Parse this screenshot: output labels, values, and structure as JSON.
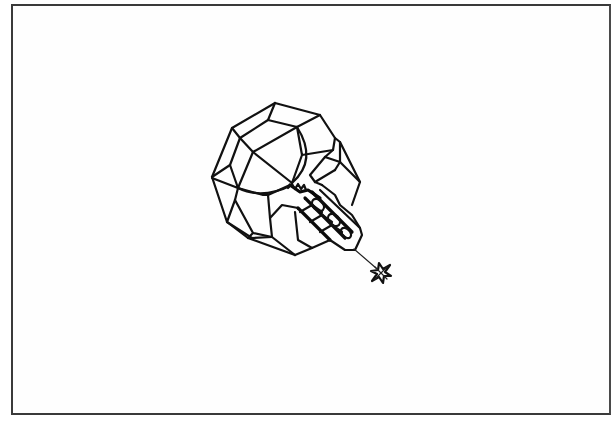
{
  "figure": {
    "colors": {
      "background": "#ffffff",
      "line": "#111111",
      "frame": "#3a3a3a"
    },
    "frame": {
      "left": 11,
      "top": 4,
      "right": 611,
      "bottom": 415
    },
    "objects": [
      {
        "name": "polyhedral-sphere",
        "center": [
          285,
          180
        ],
        "approx_radius": 78
      },
      {
        "name": "cylindrical-module",
        "from": [
          295,
          195
        ],
        "to": [
          358,
          245
        ]
      },
      {
        "name": "tether-line",
        "from": [
          354,
          249
        ],
        "to": [
          376,
          268
        ]
      },
      {
        "name": "cross-shaped-probe",
        "center": [
          381,
          273
        ],
        "size": 20
      }
    ]
  }
}
